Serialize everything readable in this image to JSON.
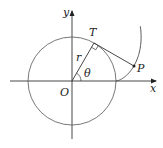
{
  "diagram": {
    "type": "involute-of-circle",
    "labels": {
      "y_axis": "y",
      "x_axis": "x",
      "origin": "O",
      "tangent_point": "T",
      "curve_point": "P",
      "radius": "r",
      "angle": "θ"
    },
    "colors": {
      "axis": "#333333",
      "circle": "#555555",
      "curve": "#444444",
      "text": "#222222"
    },
    "geometry": {
      "origin_px": [
        72,
        81
      ],
      "circle_radius_px": 44,
      "theta_deg": 60,
      "T_px": [
        94,
        43
      ],
      "P_px": [
        134,
        66
      ]
    }
  }
}
